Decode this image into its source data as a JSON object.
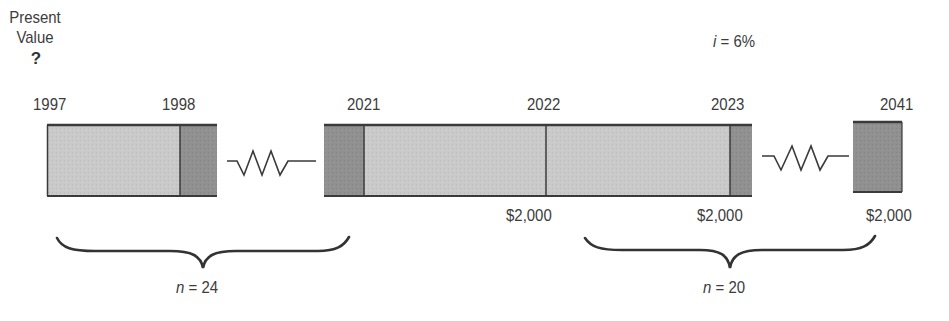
{
  "present_value": {
    "label_line1": "Present",
    "label_line2": "Value",
    "marker": "?"
  },
  "interest_rate": {
    "var": "i",
    "eq": " = 6%"
  },
  "years": {
    "y1997": "1997",
    "y1998": "1998",
    "y2021": "2021",
    "y2022": "2022",
    "y2023": "2023",
    "y2041": "2041"
  },
  "payments": {
    "p2022": "$2,000",
    "p2023": "$2,000",
    "p2041": "$2,000"
  },
  "periods": {
    "deferral": {
      "var": "n",
      "eq": " = 24"
    },
    "annuity": {
      "var": "n",
      "eq": " = 20"
    }
  },
  "colors": {
    "light_fill": "#c8c8c8",
    "dark_fill": "#8e8e8e",
    "stroke": "#3a3a3a",
    "text": "#3c3c3c"
  },
  "icons": {
    "break_symbol": "zigzag-icon",
    "brace": "curly-brace-icon"
  }
}
